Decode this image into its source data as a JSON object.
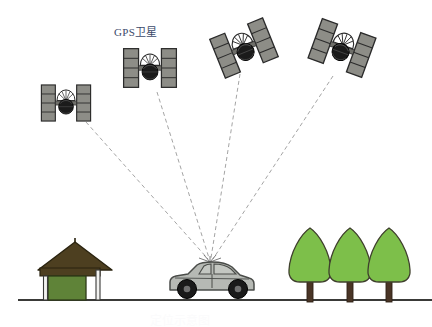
{
  "canvas": {
    "width": 432,
    "height": 327,
    "background": "#ffffff"
  },
  "labels": {
    "gps_satellite": "GPS卫星",
    "caption_faint": "定位示意图"
  },
  "colors": {
    "panel_fill": "#8d8d87",
    "panel_stroke": "#2b2b2b",
    "body_fill": "#1b1b1b",
    "dish_fill": "#ffffff",
    "signal_line": "#9a9a9a",
    "ground_line": "#3a3a38",
    "car_body": "#b6b9b4",
    "car_stroke": "#4a4c49",
    "car_window": "#c4c7c2",
    "wheel": "#1a1a1a",
    "tree_foliage": "#7dbf4a",
    "tree_stroke": "#3f3f2d",
    "tree_trunk": "#4a3526",
    "roof_fill": "#4d3f20",
    "roof_stroke": "#2a230f",
    "wall_fill": "#5f8338",
    "wall_stroke": "#2d3a18",
    "post_fill": "#e8e8e6",
    "post_stroke": "#3a3a38",
    "label_text": "#3c4a6b"
  },
  "scene": {
    "ground": {
      "y": 300,
      "x_start": 18,
      "x_end": 432
    },
    "receiver_point": {
      "x": 210,
      "y": 261
    },
    "satellites": [
      {
        "id": "sat-1",
        "cx": 66,
        "cy": 103,
        "rotation": 0,
        "scale": 0.82,
        "label": "satellite-1"
      },
      {
        "id": "sat-2",
        "cx": 150,
        "cy": 68,
        "rotation": 0,
        "scale": 0.88,
        "label": "satellite-2"
      },
      {
        "id": "sat-3",
        "cx": 244,
        "cy": 48,
        "rotation": -22,
        "scale": 0.95,
        "label": "satellite-3"
      },
      {
        "id": "sat-4",
        "cx": 342,
        "cy": 48,
        "rotation": 20,
        "scale": 0.95,
        "label": "satellite-4"
      }
    ],
    "signal_lines": [
      {
        "from": "sat-1",
        "x1": 86,
        "y1": 122,
        "x2": 208,
        "y2": 259
      },
      {
        "from": "sat-2",
        "x1": 157,
        "y1": 92,
        "x2": 209,
        "y2": 258
      },
      {
        "from": "sat-3",
        "x1": 240,
        "y1": 74,
        "x2": 211,
        "y2": 258
      },
      {
        "from": "sat-4",
        "x1": 333,
        "y1": 76,
        "x2": 213,
        "y2": 259
      }
    ],
    "car": {
      "x": 168,
      "y": 265,
      "width": 86,
      "height": 36
    },
    "trees": [
      {
        "cx": 310,
        "base_y": 300,
        "height": 72,
        "width": 42
      },
      {
        "cx": 350,
        "base_y": 300,
        "height": 72,
        "width": 42
      },
      {
        "cx": 389,
        "base_y": 300,
        "height": 72,
        "width": 42
      }
    ],
    "pavilion": {
      "x": 40,
      "base_y": 300,
      "width": 70,
      "height": 62
    }
  }
}
